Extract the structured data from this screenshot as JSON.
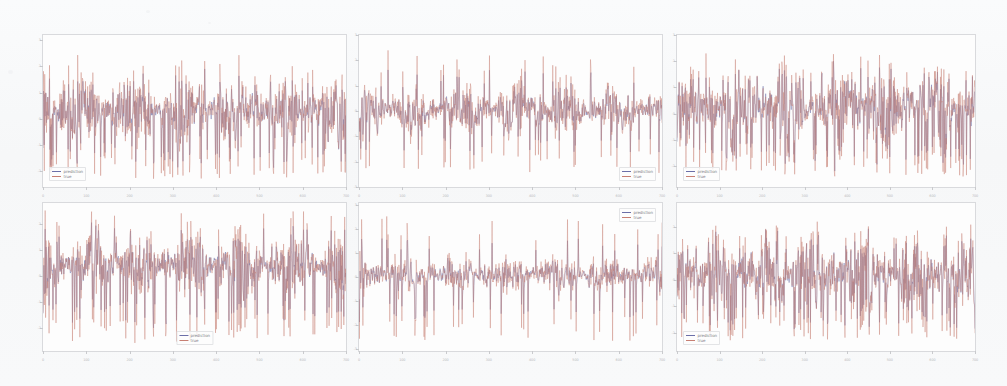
{
  "figure": {
    "title": "",
    "caption": "",
    "background_color": "#f8f9fa",
    "rows": 2,
    "cols": 3
  },
  "legend": {
    "prediction_label": "prediction",
    "true_label": "true"
  },
  "colors": {
    "prediction": "#6b6fa8",
    "true": "#c77f73",
    "axis": "#d9dadd",
    "tick": "#c9cacd",
    "ticklabel": "#b9babd",
    "panel_bg": "#fdfdfd"
  },
  "chart_data": {
    "type": "line",
    "title": "",
    "xlabel": "",
    "ylabel": "",
    "grid": false,
    "legend_entries": [
      "prediction",
      "true"
    ],
    "panels": [
      {
        "id": "panel-1",
        "row": 0,
        "col": 0,
        "legend_position": "bottom-left",
        "xlim": [
          0,
          700
        ],
        "ylim": [
          -2.6,
          3.2
        ],
        "xticks": [
          0,
          100,
          200,
          300,
          400,
          500,
          600,
          700
        ],
        "xticklabels": [
          "0",
          "100",
          "200",
          "300",
          "400",
          "500",
          "600",
          "700"
        ],
        "yticks": [
          -2,
          -1,
          0,
          1,
          2,
          3
        ],
        "yticklabels": [
          "-2",
          "-1",
          "0",
          "1",
          "2",
          "3"
        ],
        "seed": 17,
        "n_points": 700,
        "amplitude": 1.25,
        "offset": 0.35,
        "roughness": 0.92,
        "spike_rate": 0.07,
        "spike_depth": -2.3,
        "pred_lag": 0.22,
        "pred_shrink": 0.93
      },
      {
        "id": "panel-2",
        "row": 0,
        "col": 1,
        "legend_position": "bottom-right",
        "xlim": [
          0,
          700
        ],
        "ylim": [
          -3.0,
          3.0
        ],
        "xticks": [
          0,
          100,
          200,
          300,
          400,
          500,
          600,
          700
        ],
        "xticklabels": [
          "0",
          "100",
          "200",
          "300",
          "400",
          "500",
          "600",
          "700"
        ],
        "yticks": [
          -3,
          -2,
          -1,
          0,
          1,
          2,
          3
        ],
        "yticklabels": [
          "-3",
          "-2",
          "-1",
          "0",
          "1",
          "2",
          "3"
        ],
        "seed": 43,
        "n_points": 700,
        "amplitude": 0.95,
        "offset": 0.05,
        "roughness": 0.85,
        "spike_rate": 0.05,
        "spike_depth": -2.5,
        "pred_lag": 0.25,
        "pred_shrink": 0.9
      },
      {
        "id": "panel-3",
        "row": 0,
        "col": 2,
        "legend_position": "bottom-left",
        "xlim": [
          0,
          700
        ],
        "ylim": [
          -2.8,
          3.0
        ],
        "xticks": [
          0,
          100,
          200,
          300,
          400,
          500,
          600,
          700
        ],
        "xticklabels": [
          "0",
          "100",
          "200",
          "300",
          "400",
          "500",
          "600",
          "700"
        ],
        "yticks": [
          -2,
          -1,
          0,
          1,
          2,
          3
        ],
        "yticklabels": [
          "-2",
          "-1",
          "0",
          "1",
          "2",
          "3"
        ],
        "seed": 91,
        "n_points": 700,
        "amplitude": 1.35,
        "offset": 0.3,
        "roughness": 0.95,
        "spike_rate": 0.09,
        "spike_depth": -2.4,
        "pred_lag": 0.2,
        "pred_shrink": 0.95
      },
      {
        "id": "panel-4",
        "row": 1,
        "col": 0,
        "legend_position": "bottom-center",
        "xlim": [
          0,
          700
        ],
        "ylim": [
          -2.9,
          2.8
        ],
        "xticks": [
          0,
          100,
          200,
          300,
          400,
          500,
          600,
          700
        ],
        "xticklabels": [
          "0",
          "100",
          "200",
          "300",
          "400",
          "500",
          "600",
          "700"
        ],
        "yticks": [
          -2,
          -1,
          0,
          1,
          2
        ],
        "yticklabels": [
          "-2",
          "-1",
          "0",
          "1",
          "2"
        ],
        "seed": 128,
        "n_points": 700,
        "amplitude": 1.15,
        "offset": 0.45,
        "roughness": 0.9,
        "spike_rate": 0.08,
        "spike_depth": -2.6,
        "pred_lag": 0.22,
        "pred_shrink": 0.92
      },
      {
        "id": "panel-5",
        "row": 1,
        "col": 1,
        "legend_position": "top-right",
        "xlim": [
          0,
          700
        ],
        "ylim": [
          -3.1,
          3.1
        ],
        "xticks": [
          0,
          100,
          200,
          300,
          400,
          500,
          600,
          700
        ],
        "xticklabels": [
          "0",
          "100",
          "200",
          "300",
          "400",
          "500",
          "600",
          "700"
        ],
        "yticks": [
          -3,
          -2,
          -1,
          0,
          1,
          2,
          3
        ],
        "yticklabels": [
          "-3",
          "-2",
          "-1",
          "0",
          "1",
          "2",
          "3"
        ],
        "seed": 205,
        "n_points": 700,
        "amplitude": 0.8,
        "offset": 0.1,
        "roughness": 0.8,
        "spike_rate": 0.045,
        "spike_depth": -2.7,
        "pred_lag": 0.28,
        "pred_shrink": 0.88
      },
      {
        "id": "panel-6",
        "row": 1,
        "col": 2,
        "legend_position": "bottom-left",
        "xlim": [
          0,
          700
        ],
        "ylim": [
          -2.7,
          2.9
        ],
        "xticks": [
          0,
          100,
          200,
          300,
          400,
          500,
          600,
          700
        ],
        "xticklabels": [
          "0",
          "100",
          "200",
          "300",
          "400",
          "500",
          "600",
          "700"
        ],
        "yticks": [
          -2,
          -1,
          0,
          1,
          2
        ],
        "yticklabels": [
          "-2",
          "-1",
          "0",
          "1",
          "2"
        ],
        "seed": 311,
        "n_points": 700,
        "amplitude": 1.3,
        "offset": 0.25,
        "roughness": 0.93,
        "spike_rate": 0.085,
        "spike_depth": -2.3,
        "pred_lag": 0.2,
        "pred_shrink": 0.94
      }
    ]
  },
  "layout": {
    "panel_boxes": [
      {
        "left": 42,
        "top": 34,
        "width": 305,
        "height": 154
      },
      {
        "left": 358,
        "top": 34,
        "width": 305,
        "height": 154
      },
      {
        "left": 676,
        "top": 34,
        "width": 300,
        "height": 154
      },
      {
        "left": 42,
        "top": 202,
        "width": 305,
        "height": 150
      },
      {
        "left": 358,
        "top": 202,
        "width": 305,
        "height": 150
      },
      {
        "left": 676,
        "top": 202,
        "width": 300,
        "height": 150
      }
    ]
  }
}
